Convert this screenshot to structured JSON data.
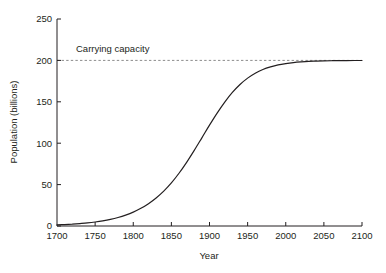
{
  "chart_data": {
    "type": "line",
    "title": "",
    "xlabel": "Year",
    "ylabel": "Population (billions)",
    "xlim": [
      1700,
      2100
    ],
    "ylim": [
      0,
      250
    ],
    "grid": false,
    "legend": "none",
    "xticks": [
      1700,
      1750,
      1800,
      1850,
      1900,
      1950,
      2000,
      2050,
      2100
    ],
    "xtick_labels": [
      "1700",
      "1750",
      "1800",
      "1850",
      "1900",
      "1950",
      "2000",
      "2050",
      "2100"
    ],
    "yticks": [
      0,
      50,
      100,
      150,
      200,
      250
    ],
    "ytick_labels": [
      "0",
      "50",
      "100",
      "150",
      "200",
      "250"
    ],
    "annotations": [
      {
        "name": "carrying-capacity",
        "text": "Carrying capacity",
        "value": 200,
        "style": "dashed-horizontal-line",
        "color": "#8c8c8c"
      }
    ],
    "series": [
      {
        "name": "population",
        "color": "#231f20",
        "line_width": 1.2,
        "x": [
          1700,
          1710,
          1720,
          1730,
          1740,
          1750,
          1760,
          1770,
          1780,
          1790,
          1800,
          1810,
          1820,
          1830,
          1840,
          1850,
          1860,
          1870,
          1880,
          1890,
          1900,
          1910,
          1920,
          1930,
          1940,
          1950,
          1960,
          1970,
          1980,
          1990,
          2000,
          2010,
          2020,
          2030,
          2040,
          2050,
          2060,
          2070,
          2080,
          2090,
          2100
        ],
        "values": [
          1.3,
          1.7,
          2.2,
          2.9,
          3.7,
          4.8,
          6.2,
          8.0,
          10.3,
          13.2,
          16.8,
          21.4,
          27.0,
          33.9,
          42.2,
          52.1,
          63.7,
          76.9,
          91.3,
          106.5,
          121.8,
          136.4,
          149.7,
          161.3,
          170.9,
          178.6,
          184.5,
          189.0,
          192.2,
          194.6,
          196.2,
          197.4,
          198.2,
          198.8,
          199.1,
          199.4,
          199.6,
          199.7,
          199.8,
          199.9,
          199.9
        ],
        "model": "logistic",
        "carrying_capacity": 200,
        "inflection_year": 1905,
        "growth_rate_per_year": 0.0256
      }
    ]
  },
  "figure": {
    "background_color": "#ffffff",
    "axis_color": "#231f20",
    "text_color": "#231f20"
  }
}
